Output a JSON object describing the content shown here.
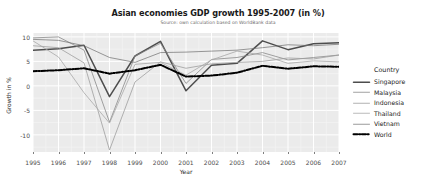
{
  "chart_data": {
    "type": "line",
    "title": "Asian economies GDP growth 1995-2007 (in %)",
    "subtitle": "Source: own calculation based on WorldBank data",
    "xlabel": "Year",
    "ylabel": "Growth in %",
    "legend_title": "Country",
    "legend_position": "right",
    "grid": true,
    "x": [
      1995,
      1996,
      1997,
      1998,
      1999,
      2000,
      2001,
      2002,
      2003,
      2004,
      2005,
      2006,
      2007
    ],
    "xticklabels": [
      "1995",
      "1996",
      "1997",
      "1998",
      "1999",
      "2000",
      "2001",
      "2002",
      "2003",
      "2004",
      "2005",
      "2006",
      "2007"
    ],
    "yticklabels": [
      "10",
      "5",
      "0",
      "-5",
      "-10"
    ],
    "yticks": [
      10,
      5,
      0,
      -5,
      -10
    ],
    "xlim": [
      1995,
      2007
    ],
    "ylim": [
      -13.5,
      10.8
    ],
    "series": [
      {
        "name": "Singapore",
        "color": "#4d4d4d",
        "style": "solid",
        "width": 1.5,
        "values": [
          7.3,
          7.6,
          8.3,
          -2.2,
          6.1,
          9.1,
          -1.0,
          4.2,
          4.6,
          9.2,
          7.4,
          8.6,
          8.8
        ]
      },
      {
        "name": "Malaysia",
        "color": "#8a8a8a",
        "style": "solid",
        "width": 0.8,
        "values": [
          9.8,
          10.0,
          7.3,
          -7.4,
          6.1,
          8.7,
          0.5,
          5.4,
          5.8,
          6.8,
          5.3,
          5.8,
          6.3
        ]
      },
      {
        "name": "Indonesia",
        "color": "#9e9e9e",
        "style": "solid",
        "width": 0.8,
        "values": [
          8.2,
          7.8,
          4.7,
          -13.1,
          0.8,
          4.9,
          3.6,
          4.5,
          4.8,
          5.0,
          5.7,
          5.5,
          6.3
        ]
      },
      {
        "name": "Thailand",
        "color": "#a8a8a8",
        "style": "solid",
        "width": 0.8,
        "values": [
          9.2,
          5.9,
          -1.4,
          -7.6,
          4.4,
          4.8,
          2.2,
          5.3,
          7.1,
          6.3,
          4.6,
          5.1,
          4.9
        ]
      },
      {
        "name": "Vietnam",
        "color": "#6f6f6f",
        "style": "solid",
        "width": 0.7,
        "values": [
          9.5,
          9.3,
          8.2,
          5.8,
          4.8,
          6.8,
          6.9,
          7.1,
          7.3,
          7.8,
          8.4,
          8.2,
          8.5
        ]
      },
      {
        "name": "World",
        "color": "#000000",
        "style": "dashdot",
        "width": 2.0,
        "values": [
          3.0,
          3.2,
          3.6,
          2.5,
          3.2,
          4.3,
          1.9,
          2.1,
          2.7,
          4.1,
          3.5,
          4.0,
          3.9
        ]
      }
    ]
  },
  "panel": {
    "background": "#ebebeb",
    "gridline_major": "#ffffff",
    "gridline_minor": "#f5f5f5"
  }
}
